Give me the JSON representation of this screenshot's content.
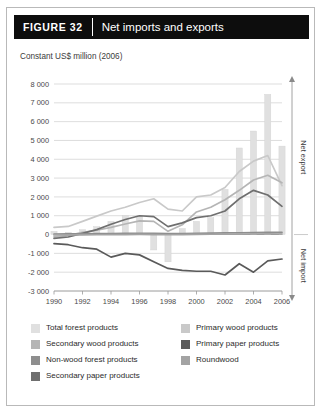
{
  "figure": {
    "tag": "FIGURE  32",
    "title": "Net imports and exports"
  },
  "subtitle": "Constant US$ million (2006)",
  "axis_right": {
    "export_label": "Net export",
    "import_label": "Net import"
  },
  "legend": {
    "left": [
      {
        "label": "Total forest products",
        "color": "#e0e0e0"
      },
      {
        "label": "Secondary wood products",
        "color": "#b5b5b5"
      },
      {
        "label": "Non-wood forest products",
        "color": "#8e8e8e"
      },
      {
        "label": "Secondary paper products",
        "color": "#6f6f6f"
      }
    ],
    "right": [
      {
        "label": "Primary wood products",
        "color": "#c9c9c9"
      },
      {
        "label": "Primary paper products",
        "color": "#5a5a5a"
      },
      {
        "label": "Roundwood",
        "color": "#a3a3a3"
      }
    ]
  },
  "chart_data": {
    "type": "bar",
    "title": "Net imports and exports",
    "subtitle": "Constant US$ million (2006)",
    "xlabel": "",
    "ylabel": "Constant US$ million (2006)",
    "ylim": [
      -3000,
      8000
    ],
    "ytick_step": 1000,
    "yticks": [
      "8 000",
      "7 000",
      "6 000",
      "5 000",
      "4 000",
      "3 000",
      "2 000",
      "1 000",
      "0",
      "-1 000",
      "-2 000",
      "-3 000"
    ],
    "ytick_values": [
      8000,
      7000,
      6000,
      5000,
      4000,
      3000,
      2000,
      1000,
      0,
      -1000,
      -2000,
      -3000
    ],
    "grid": true,
    "legend_position": "bottom",
    "x": [
      1990,
      1991,
      1992,
      1993,
      1994,
      1995,
      1996,
      1997,
      1998,
      1999,
      2000,
      2001,
      2002,
      2003,
      2004,
      2005,
      2006
    ],
    "xtick_labels": [
      "1990",
      "1992",
      "1994",
      "1996",
      "1998",
      "2000",
      "2002",
      "2004",
      "2006"
    ],
    "xtick_values": [
      1990,
      1992,
      1994,
      1996,
      1998,
      2000,
      2002,
      2004,
      2006
    ],
    "bars": {
      "name": "Total forest products",
      "color": "#e0e0e0",
      "values": [
        170,
        120,
        260,
        420,
        700,
        1000,
        980,
        -820,
        -1450,
        320,
        700,
        900,
        2400,
        4600,
        5500,
        7450,
        4700
      ]
    },
    "series": [
      {
        "name": "Primary wood products",
        "color": "#c9c9c9",
        "type": "line",
        "values": [
          380,
          430,
          700,
          980,
          1250,
          1450,
          1700,
          1900,
          1350,
          1250,
          2000,
          2100,
          2500,
          3350,
          3900,
          4200,
          2600
        ]
      },
      {
        "name": "Secondary wood products",
        "color": "#b5b5b5",
        "type": "line",
        "values": [
          -120,
          -60,
          120,
          230,
          380,
          560,
          730,
          700,
          170,
          520,
          1200,
          1450,
          1850,
          2350,
          2900,
          3150,
          2750
        ]
      },
      {
        "name": "Primary paper products",
        "color": "#5a5a5a",
        "type": "line",
        "values": [
          -480,
          -540,
          -700,
          -780,
          -1200,
          -1000,
          -1080,
          -1450,
          -1800,
          -1900,
          -1950,
          -1950,
          -2150,
          -1550,
          -2000,
          -1400,
          -1300
        ]
      },
      {
        "name": "Secondary paper products",
        "color": "#6f6f6f",
        "type": "line",
        "values": [
          -200,
          -130,
          60,
          260,
          550,
          800,
          1000,
          950,
          420,
          620,
          900,
          1000,
          1250,
          1900,
          2350,
          2100,
          1500
        ]
      },
      {
        "name": "Non-wood forest products",
        "color": "#8e8e8e",
        "type": "line",
        "values": [
          30,
          35,
          40,
          45,
          55,
          65,
          70,
          60,
          45,
          55,
          70,
          75,
          85,
          95,
          105,
          115,
          120
        ]
      },
      {
        "name": "Roundwood",
        "color": "#a3a3a3",
        "type": "line",
        "values": [
          -20,
          -20,
          -15,
          -10,
          -5,
          0,
          5,
          0,
          -10,
          0,
          10,
          15,
          20,
          25,
          30,
          35,
          30
        ]
      }
    ]
  }
}
